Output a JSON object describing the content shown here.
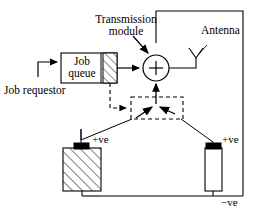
{
  "diagram": {
    "labels": {
      "transmission_module_line1": "Transmission",
      "transmission_module_line2": "module",
      "antenna": "Antenna",
      "job_queue_line1": "Job",
      "job_queue_line2": "queue",
      "job_requestor": "Job requestor",
      "left_battery_terminal": "+ve",
      "right_battery_terminal": "+ve",
      "negative_rail": "−ve",
      "summing_node": "+"
    },
    "nodes": [
      {
        "name": "job-queue-box",
        "label": "Job queue",
        "shape": "rectangle",
        "fill": "#ffffff"
      },
      {
        "name": "job-queue-hatched-segment",
        "label": "",
        "shape": "rectangle-hatched",
        "fill": "#ffffff"
      },
      {
        "name": "summing-junction",
        "label": "+",
        "shape": "circle",
        "fill": "#ffffff"
      },
      {
        "name": "antenna-symbol",
        "label": "Antenna",
        "shape": "y-antenna",
        "fill": "none"
      },
      {
        "name": "switch-dashed-box",
        "label": "",
        "shape": "dashed-rectangle",
        "fill": "none"
      },
      {
        "name": "left-battery",
        "label": "+ve",
        "shape": "rectangle-hatched",
        "fill": "#ffffff"
      },
      {
        "name": "right-battery",
        "label": "+ve",
        "shape": "rectangle",
        "fill": "#ffffff"
      }
    ],
    "colors": {
      "stroke": "#000000",
      "fill": "#ffffff",
      "terminal": "#000000",
      "background": "#ffffff"
    }
  }
}
